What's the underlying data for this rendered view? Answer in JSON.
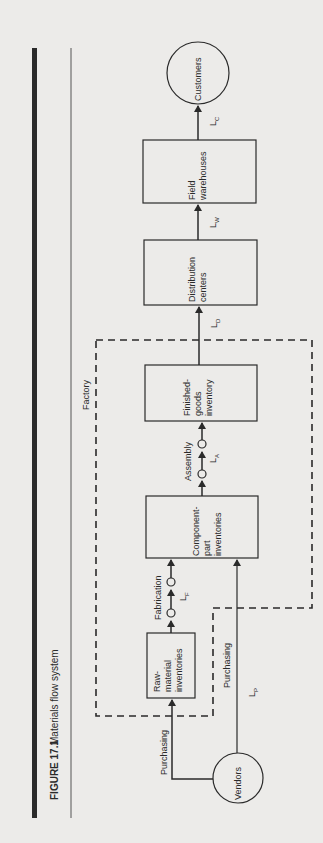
{
  "figure": {
    "number": "FIGURE 17.1",
    "title": "Materials flow system",
    "region_label": "Factory"
  },
  "nodes": {
    "customers": "Customers",
    "field_warehouses": [
      "Field",
      "warehouses"
    ],
    "distribution_centers": [
      "Distribution",
      "centers"
    ],
    "finished_goods": [
      "Finished-",
      "goods",
      "inventory"
    ],
    "component_part": [
      "Component-",
      "part",
      "inventories"
    ],
    "raw_material": [
      "Raw-",
      "material",
      "inventories"
    ],
    "vendors": "Vendors"
  },
  "edges": {
    "purchasing_raw": "Purchasing",
    "purchasing_component": "Purchasing",
    "fabrication": "Fabrication",
    "assembly": "Assembly",
    "lead_times": {
      "L_P": {
        "main": "L",
        "sub": "P"
      },
      "L_F": {
        "main": "L",
        "sub": "F"
      },
      "L_A": {
        "main": "L",
        "sub": "A"
      },
      "L_D": {
        "main": "L",
        "sub": "D"
      },
      "L_W": {
        "main": "L",
        "sub": "W"
      },
      "L_C": {
        "main": "L",
        "sub": "C"
      }
    }
  },
  "colors": {
    "background": "#ecebe9",
    "ink": "#2a2a2a"
  }
}
